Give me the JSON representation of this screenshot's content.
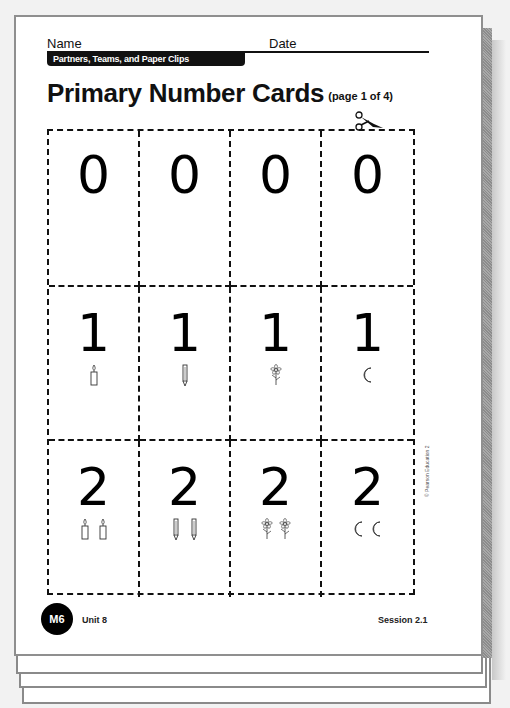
{
  "header": {
    "name_label": "Name",
    "date_label": "Date",
    "unit_banner": "Partners, Teams, and Paper Clips"
  },
  "title": {
    "main": "Primary Number Cards",
    "sub": "(page 1 of 4)"
  },
  "cut_icon": "scissors-icon",
  "cards": [
    {
      "number": "0",
      "count": 0,
      "picture": "none"
    },
    {
      "number": "0",
      "count": 0,
      "picture": "none"
    },
    {
      "number": "0",
      "count": 0,
      "picture": "none"
    },
    {
      "number": "0",
      "count": 0,
      "picture": "none"
    },
    {
      "number": "1",
      "count": 1,
      "picture": "candle-icon"
    },
    {
      "number": "1",
      "count": 1,
      "picture": "pencil-icon"
    },
    {
      "number": "1",
      "count": 1,
      "picture": "flower-icon"
    },
    {
      "number": "1",
      "count": 1,
      "picture": "moon-icon"
    },
    {
      "number": "2",
      "count": 2,
      "picture": "candle-icon"
    },
    {
      "number": "2",
      "count": 2,
      "picture": "pencil-icon"
    },
    {
      "number": "2",
      "count": 2,
      "picture": "flower-icon"
    },
    {
      "number": "2",
      "count": 2,
      "picture": "moon-icon"
    }
  ],
  "copyright": "© Pearson Education 2",
  "footer": {
    "badge": "M6",
    "unit": "Unit 8",
    "session": "Session 2.1"
  }
}
